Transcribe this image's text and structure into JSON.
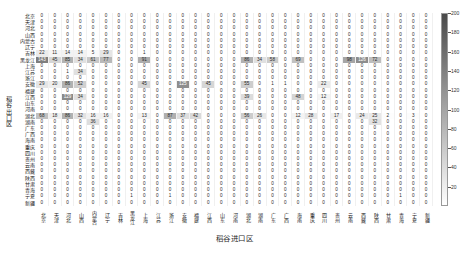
{
  "chart_data": {
    "type": "heatmap",
    "title": "",
    "xlabel": "稻谷进口区",
    "ylabel": "稻谷出口区",
    "colorbar": {
      "min": 0,
      "max": 200,
      "ticks": [
        200,
        180,
        160,
        140,
        120,
        100,
        80,
        60,
        40,
        20
      ],
      "colormap": "grayscale-reversed",
      "low_color": "#ffffff",
      "high_color": "#4a4a4a"
    },
    "categories": [
      "北京",
      "天津",
      "河北",
      "山西",
      "内蒙古",
      "辽宁",
      "吉林",
      "黑龙江",
      "上海",
      "江苏",
      "浙江",
      "安徽",
      "福建",
      "江西",
      "山东",
      "河南",
      "湖北",
      "湖南",
      "广东",
      "广西",
      "海南",
      "重庆",
      "四川",
      "贵州",
      "云南",
      "西藏",
      "陕西",
      "甘肃",
      "青海",
      "宁夏",
      "新疆"
    ],
    "row_categories": [
      "北京",
      "天津",
      "河北",
      "山西",
      "内蒙古",
      "辽宁",
      "吉林",
      "黑龙江",
      "上海",
      "江苏",
      "浙江",
      "安徽",
      "福建",
      "江西",
      "山东",
      "河南",
      "湖北",
      "湖南",
      "广东",
      "广西",
      "海南",
      "重庆",
      "四川",
      "贵州",
      "云南",
      "西藏",
      "陕西",
      "甘肃",
      "青海",
      "宁夏",
      "新疆"
    ],
    "values": [
      [
        0,
        0,
        0,
        0,
        0,
        0,
        0,
        0,
        0,
        0,
        0,
        0,
        0,
        0,
        0,
        0,
        0,
        0,
        0,
        0,
        0,
        0,
        0,
        0,
        0,
        0,
        0,
        0,
        0,
        0,
        0
      ],
      [
        0,
        0,
        0,
        0,
        0,
        0,
        0,
        0,
        0,
        0,
        0,
        0,
        0,
        0,
        0,
        0,
        0,
        0,
        0,
        0,
        0,
        0,
        0,
        0,
        0,
        0,
        0,
        0,
        0,
        0,
        0
      ],
      [
        0,
        0,
        0,
        0,
        0,
        0,
        0,
        0,
        0,
        0,
        0,
        0,
        0,
        0,
        0,
        0,
        0,
        0,
        0,
        0,
        0,
        0,
        0,
        0,
        0,
        0,
        0,
        0,
        0,
        0,
        0
      ],
      [
        0,
        0,
        0,
        0,
        0,
        0,
        0,
        0,
        0,
        0,
        0,
        0,
        0,
        0,
        0,
        0,
        0,
        0,
        0,
        0,
        0,
        0,
        0,
        0,
        0,
        0,
        0,
        0,
        0,
        0,
        0
      ],
      [
        0,
        0,
        0,
        0,
        0,
        0,
        0,
        0,
        0,
        0,
        0,
        0,
        0,
        0,
        0,
        0,
        0,
        0,
        0,
        0,
        0,
        0,
        0,
        0,
        0,
        0,
        0,
        0,
        0,
        0,
        0
      ],
      [
        0,
        0,
        0,
        0,
        0,
        0,
        0,
        0,
        0,
        0,
        0,
        0,
        0,
        0,
        0,
        0,
        0,
        0,
        0,
        0,
        0,
        0,
        0,
        0,
        0,
        0,
        0,
        0,
        0,
        0,
        0
      ],
      [
        22,
        11,
        14,
        14,
        5,
        29,
        0,
        0,
        1,
        0,
        0,
        0,
        0,
        0,
        0,
        0,
        0,
        0,
        0,
        0,
        0,
        0,
        0,
        0,
        0,
        0,
        0,
        0,
        0,
        0,
        0
      ],
      [
        143,
        45,
        85,
        34,
        61,
        77,
        0,
        0,
        91,
        0,
        0,
        0,
        0,
        0,
        0,
        0,
        86,
        34,
        58,
        0,
        69,
        0,
        0,
        0,
        98,
        126,
        72,
        0,
        0,
        0,
        0
      ],
      [
        0,
        0,
        0,
        0,
        0,
        0,
        0,
        0,
        0,
        0,
        0,
        0,
        0,
        0,
        0,
        0,
        0,
        0,
        0,
        0,
        0,
        0,
        0,
        0,
        0,
        0,
        0,
        0,
        0,
        0,
        0
      ],
      [
        0,
        0,
        1,
        34,
        0,
        0,
        0,
        0,
        0,
        0,
        0,
        0,
        0,
        0,
        0,
        0,
        0,
        0,
        0,
        0,
        0,
        0,
        0,
        0,
        0,
        0,
        0,
        0,
        0,
        0,
        0
      ],
      [
        0,
        0,
        0,
        0,
        0,
        0,
        0,
        0,
        0,
        0,
        0,
        0,
        0,
        0,
        0,
        0,
        0,
        0,
        0,
        0,
        0,
        0,
        0,
        0,
        0,
        0,
        0,
        0,
        0,
        0,
        0
      ],
      [
        29,
        20,
        86,
        52,
        0,
        0,
        0,
        0,
        45,
        0,
        0,
        125,
        0,
        45,
        0,
        0,
        55,
        0,
        1,
        1,
        0,
        0,
        22,
        0,
        0,
        0,
        0,
        0,
        0,
        0,
        0
      ],
      [
        0,
        0,
        0,
        0,
        0,
        0,
        0,
        0,
        0,
        0,
        0,
        0,
        0,
        0,
        0,
        0,
        0,
        0,
        0,
        0,
        0,
        0,
        0,
        0,
        0,
        0,
        0,
        0,
        0,
        0,
        0
      ],
      [
        0,
        0,
        129,
        34,
        0,
        0,
        0,
        0,
        0,
        0,
        0,
        0,
        0,
        0,
        0,
        0,
        39,
        0,
        0,
        0,
        48,
        0,
        12,
        0,
        0,
        0,
        0,
        0,
        0,
        0,
        0
      ],
      [
        0,
        0,
        0,
        0,
        0,
        0,
        0,
        0,
        0,
        0,
        0,
        0,
        0,
        0,
        0,
        0,
        0,
        0,
        0,
        0,
        0,
        0,
        0,
        0,
        0,
        0,
        0,
        0,
        0,
        0,
        0
      ],
      [
        0,
        0,
        0,
        0,
        0,
        0,
        0,
        0,
        0,
        0,
        0,
        0,
        0,
        0,
        0,
        0,
        0,
        0,
        0,
        0,
        0,
        0,
        0,
        0,
        0,
        0,
        0,
        0,
        0,
        0,
        0
      ],
      [
        68,
        18,
        86,
        32,
        16,
        16,
        0,
        0,
        13,
        0,
        87,
        37,
        42,
        0,
        0,
        0,
        56,
        26,
        0,
        0,
        12,
        28,
        0,
        17,
        0,
        24,
        25,
        2,
        0,
        3,
        0
      ],
      [
        0,
        0,
        0,
        0,
        36,
        0,
        0,
        0,
        0,
        0,
        0,
        0,
        0,
        0,
        0,
        0,
        0,
        0,
        0,
        0,
        0,
        0,
        0,
        0,
        0,
        0,
        32,
        0,
        0,
        0,
        0
      ],
      [
        0,
        0,
        0,
        0,
        0,
        0,
        0,
        0,
        0,
        0,
        0,
        0,
        0,
        0,
        0,
        0,
        0,
        0,
        0,
        0,
        0,
        0,
        0,
        0,
        0,
        0,
        0,
        0,
        0,
        0,
        0
      ],
      [
        0,
        0,
        0,
        0,
        0,
        0,
        0,
        0,
        0,
        0,
        0,
        0,
        0,
        0,
        0,
        0,
        0,
        0,
        0,
        0,
        0,
        0,
        0,
        0,
        0,
        0,
        0,
        0,
        0,
        0,
        0
      ],
      [
        0,
        0,
        0,
        0,
        0,
        0,
        0,
        0,
        0,
        0,
        0,
        0,
        0,
        0,
        0,
        0,
        0,
        0,
        0,
        0,
        0,
        0,
        0,
        0,
        0,
        0,
        0,
        0,
        0,
        0,
        0
      ],
      [
        0,
        0,
        0,
        0,
        0,
        0,
        0,
        0,
        0,
        0,
        0,
        0,
        0,
        0,
        0,
        0,
        0,
        0,
        0,
        0,
        0,
        0,
        0,
        0,
        0,
        0,
        0,
        0,
        0,
        0,
        0
      ],
      [
        0,
        0,
        0,
        0,
        0,
        0,
        0,
        0,
        0,
        0,
        0,
        0,
        0,
        0,
        0,
        0,
        0,
        0,
        0,
        0,
        0,
        0,
        0,
        0,
        0,
        0,
        0,
        0,
        0,
        0,
        0
      ],
      [
        0,
        0,
        0,
        0,
        0,
        0,
        0,
        0,
        0,
        0,
        0,
        0,
        0,
        0,
        0,
        0,
        0,
        0,
        0,
        0,
        0,
        0,
        0,
        0,
        0,
        0,
        0,
        0,
        0,
        0,
        0
      ],
      [
        0,
        0,
        0,
        0,
        0,
        0,
        0,
        0,
        0,
        0,
        0,
        0,
        0,
        0,
        0,
        0,
        0,
        0,
        0,
        0,
        0,
        0,
        0,
        0,
        0,
        0,
        0,
        0,
        0,
        0,
        0
      ],
      [
        0,
        0,
        0,
        0,
        0,
        0,
        0,
        0,
        0,
        0,
        0,
        0,
        0,
        0,
        0,
        0,
        0,
        0,
        0,
        0,
        0,
        0,
        0,
        0,
        0,
        0,
        0,
        0,
        0,
        0,
        0
      ],
      [
        0,
        0,
        0,
        0,
        0,
        0,
        0,
        0,
        0,
        0,
        0,
        0,
        0,
        0,
        0,
        0,
        0,
        0,
        0,
        0,
        0,
        0,
        0,
        0,
        0,
        0,
        0,
        0,
        0,
        0,
        0
      ],
      [
        0,
        0,
        0,
        0,
        0,
        0,
        0,
        0,
        0,
        0,
        0,
        0,
        0,
        0,
        0,
        0,
        0,
        0,
        0,
        0,
        0,
        0,
        0,
        0,
        0,
        0,
        0,
        0,
        0,
        0,
        0
      ],
      [
        0,
        0,
        0,
        0,
        0,
        0,
        0,
        0,
        0,
        0,
        0,
        0,
        0,
        0,
        0,
        0,
        0,
        0,
        0,
        0,
        0,
        0,
        0,
        0,
        0,
        0,
        0,
        0,
        0,
        0,
        0
      ],
      [
        0,
        0,
        0,
        0,
        0,
        0,
        0,
        1,
        0,
        0,
        1,
        0,
        0,
        0,
        0,
        0,
        0,
        0,
        0,
        0,
        0,
        0,
        0,
        0,
        0,
        0,
        0,
        0,
        1,
        0,
        0
      ],
      [
        0,
        0,
        0,
        0,
        0,
        0,
        0,
        0,
        0,
        0,
        0,
        0,
        0,
        0,
        0,
        0,
        0,
        0,
        0,
        0,
        0,
        0,
        0,
        0,
        0,
        0,
        0,
        0,
        0,
        0,
        0
      ]
    ]
  }
}
